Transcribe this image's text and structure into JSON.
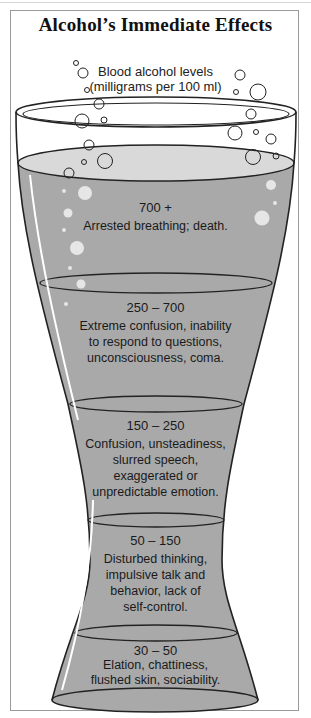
{
  "title": "Alcohol’s Immediate Effects",
  "subtitle": {
    "line1": "Blood alcohol levels",
    "line2": "(milligrams per 100 ml)"
  },
  "colors": {
    "liquid": "#a9a9a9",
    "liquid_surface": "#d9d9d9",
    "outline": "#222222",
    "bubble_fill": "#e6e6e6",
    "frame": "#9a9a9a"
  },
  "levels": [
    {
      "range": "700 +",
      "lines": [
        "Arrested breathing; death."
      ]
    },
    {
      "range": "250 – 700",
      "lines": [
        "Extreme confusion, inability",
        "to respond to questions,",
        "unconsciousness, coma."
      ]
    },
    {
      "range": "150 – 250",
      "lines": [
        "Confusion, unsteadiness,",
        "slurred speech,",
        "exaggerated or",
        "unpredictable emotion."
      ]
    },
    {
      "range": "50 – 150",
      "lines": [
        "Disturbed thinking,",
        "impulsive talk and",
        "behavior, lack of",
        "self-control."
      ]
    },
    {
      "range": "30 – 50",
      "lines": [
        "Elation, chattiness,",
        "flushed skin, sociability."
      ]
    }
  ]
}
